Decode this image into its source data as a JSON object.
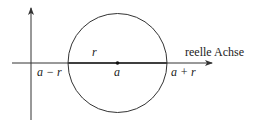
{
  "figure": {
    "type": "complex plane disk diagram",
    "center_label": "a",
    "radius_label": "r",
    "left_point_label": "a − r",
    "right_point_label": "a + r",
    "axis_label": "reelle Achse",
    "colors": {
      "stroke": "#333333",
      "text": "#222222",
      "background": "#ffffff"
    }
  }
}
